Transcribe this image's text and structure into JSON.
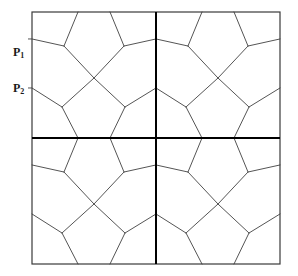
{
  "figure": {
    "type": "geometric-tiling-diagram",
    "background_color": "#ffffff"
  },
  "labels": [
    {
      "id": "p1",
      "base": "P",
      "subscript": "1",
      "text": "P1",
      "x": 13,
      "y": 46
    },
    {
      "id": "p2",
      "base": "P",
      "subscript": "2",
      "text": "P2",
      "x": 13,
      "y": 82
    }
  ],
  "colors": {
    "tile_edge": "#555555",
    "quadrant_divider": "#000000",
    "outer_border": "#3a3a3a",
    "label": "#1a1a1a",
    "background": "#ffffff"
  },
  "stroke_widths": {
    "tile_edge": 1,
    "quadrant_divider": 2,
    "outer_border": 1.2
  },
  "geometry": {
    "square": {
      "x": 32,
      "y": 12,
      "width": 248,
      "height": 252
    },
    "center": {
      "x": 156,
      "y": 138
    },
    "quadrant_size": {
      "width": 124,
      "height": 126
    },
    "quadrants": [
      {
        "name": "top-left",
        "origin_x": 32,
        "origin_y": 12
      },
      {
        "name": "top-right",
        "origin_x": 156,
        "origin_y": 12
      },
      {
        "name": "bottom-left",
        "origin_x": 32,
        "origin_y": 138
      },
      {
        "name": "bottom-right",
        "origin_x": 156,
        "origin_y": 138
      }
    ],
    "unit_cell_vertices": {
      "note": "Coordinates are fractions of the quadrant cell (0..1 in x and y)",
      "top_left_node": {
        "x": 0.258,
        "y": 0.27
      },
      "top_right_node": {
        "x": 0.742,
        "y": 0.27
      },
      "bottom_left_node": {
        "x": 0.242,
        "y": 0.754
      },
      "bottom_right_node": {
        "x": 0.75,
        "y": 0.754
      },
      "center_node": {
        "x": 0.5,
        "y": 0.524
      },
      "edge_contacts": {
        "top_a": 0.371,
        "top_b": 0.629,
        "bottom_a": 0.371,
        "bottom_b": 0.629,
        "left_a": 0.214,
        "left_b": 0.603,
        "right_a": 0.214,
        "right_b": 0.603
      }
    }
  },
  "chart_data": {
    "type": "diagram",
    "annotations": [
      "P1",
      "P2"
    ]
  }
}
